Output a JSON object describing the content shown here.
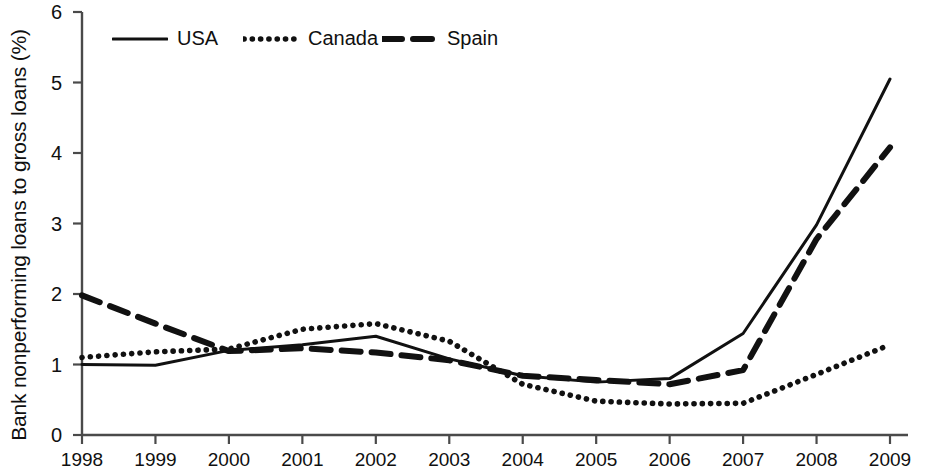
{
  "chart_data": {
    "type": "line",
    "title": "",
    "xlabel": "",
    "ylabel": "Bank nonperforming loans to gross loans (%)",
    "x": [
      1998,
      1999,
      2000,
      2001,
      2002,
      2003,
      2004,
      2005,
      2006,
      2007,
      2008,
      2009
    ],
    "categories": [
      "1998",
      "1999",
      "2000",
      "2001",
      "2002",
      "2003",
      "2004",
      "2005",
      "2006",
      "2007",
      "2008",
      "2009"
    ],
    "xlim": [
      1998,
      2009
    ],
    "ylim": [
      0,
      6
    ],
    "yticks": [
      0,
      1,
      2,
      3,
      4,
      5,
      6
    ],
    "ytick_labels": [
      "0",
      "1",
      "2",
      "3",
      "4",
      "5",
      "6"
    ],
    "grid": false,
    "legend_position": "top-left",
    "series": [
      {
        "name": "USA",
        "style": "solid",
        "color": "#111111",
        "values": [
          1.0,
          0.99,
          1.2,
          1.28,
          1.4,
          1.08,
          0.84,
          0.75,
          0.8,
          1.44,
          2.98,
          5.05
        ]
      },
      {
        "name": "Canada",
        "style": "dotted",
        "color": "#111111",
        "values": [
          1.1,
          1.18,
          1.22,
          1.5,
          1.58,
          1.33,
          0.72,
          0.48,
          0.44,
          0.45,
          0.86,
          1.28
        ]
      },
      {
        "name": "Spain",
        "style": "dashed",
        "color": "#111111",
        "values": [
          1.98,
          1.58,
          1.19,
          1.23,
          1.17,
          1.06,
          0.84,
          0.78,
          0.72,
          0.92,
          2.78,
          4.08
        ]
      }
    ]
  },
  "legend": {
    "items": [
      {
        "label": "USA",
        "style": "solid"
      },
      {
        "label": "Canada",
        "style": "dotted"
      },
      {
        "label": "Spain",
        "style": "dashed"
      }
    ]
  },
  "axes": {
    "y_axis_title": "Bank nonperforming loans to gross loans (%)"
  }
}
